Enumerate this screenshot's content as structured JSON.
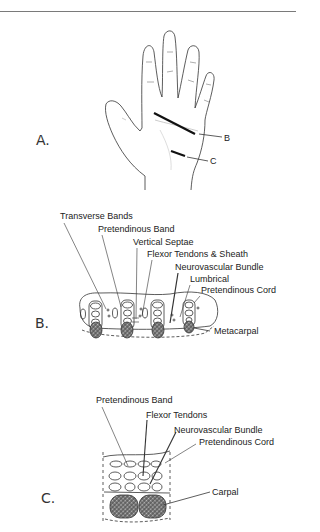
{
  "figure": {
    "panels": [
      {
        "id": "A",
        "label": "A.",
        "callouts": [
          "B",
          "C"
        ]
      },
      {
        "id": "B",
        "label": "B.",
        "callouts": [
          "Transverse Bands",
          "Pretendinous Band",
          "Vertical Septae",
          "Flexor Tendons & Sheath",
          "Neurovascular Bundle",
          "Lumbrical",
          "Pretendinous Cord",
          "Metacarpal"
        ]
      },
      {
        "id": "C",
        "label": "C.",
        "callouts": [
          "Pretendinous Band",
          "Flexor Tendons",
          "Neurovascular Bundle",
          "Pretendinous Cord",
          "Carpal"
        ]
      }
    ]
  }
}
